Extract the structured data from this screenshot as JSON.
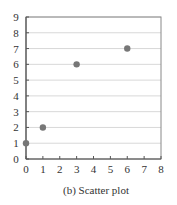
{
  "chart_data": {
    "type": "scatter",
    "title": "",
    "caption": "(b) Scatter plot",
    "xlabel": "",
    "ylabel": "",
    "xlim": [
      0,
      8
    ],
    "ylim": [
      0,
      9
    ],
    "xticks": [
      0,
      1,
      2,
      3,
      4,
      5,
      6,
      7,
      8
    ],
    "yticks": [
      0,
      1,
      2,
      3,
      4,
      5,
      6,
      7,
      8,
      9
    ],
    "grid": {
      "horizontal": true,
      "vertical": false
    },
    "legend": null,
    "series": [
      {
        "name": "points",
        "color": "#777777",
        "points": [
          {
            "x": 0,
            "y": 1
          },
          {
            "x": 1,
            "y": 2
          },
          {
            "x": 3,
            "y": 6
          },
          {
            "x": 6,
            "y": 7
          }
        ]
      }
    ]
  },
  "colors": {
    "axis": "#888888",
    "grid": "#d8d8d8",
    "marker": "#777777",
    "text": "#333333"
  }
}
